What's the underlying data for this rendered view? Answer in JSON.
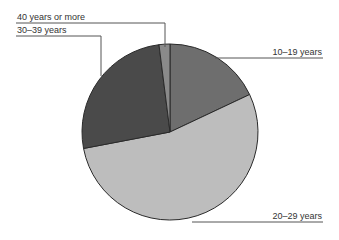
{
  "chart_data": {
    "type": "pie",
    "title": "",
    "categories": [
      "10–19 years",
      "20–29 years",
      "30–39 years",
      "40 years or more"
    ],
    "values": [
      18,
      54,
      26,
      2
    ],
    "unit": "%",
    "start_angle_deg": 0,
    "direction": "clockwise",
    "colors": [
      "#6e6e6e",
      "#bdbdbd",
      "#4a4a4a",
      "#8a8a8a"
    ],
    "legend": "leader-line labels"
  },
  "labels": {
    "l0": "10–19 years",
    "l1": "20–29 years",
    "l2": "30–39 years",
    "l3": "40 years or more"
  }
}
